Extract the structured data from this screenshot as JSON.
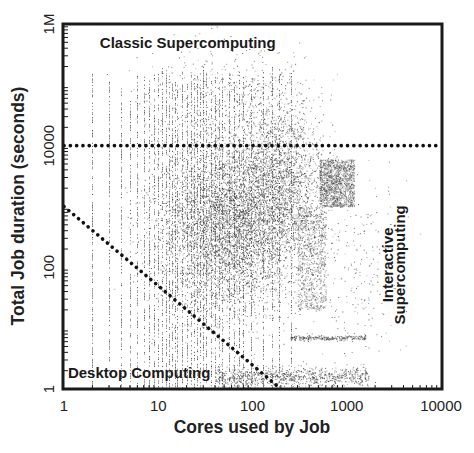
{
  "chart_data": {
    "type": "scatter",
    "title": "",
    "xlabel": "Cores used by Job",
    "ylabel": "Total Job duration (seconds)",
    "xscale": "log",
    "yscale": "log",
    "xlim": [
      1,
      10000
    ],
    "ylim": [
      1,
      1000000
    ],
    "x_ticks": [
      {
        "value": 1,
        "label": "1"
      },
      {
        "value": 10,
        "label": "10"
      },
      {
        "value": 100,
        "label": "100"
      },
      {
        "value": 1000,
        "label": "1000"
      },
      {
        "value": 10000,
        "label": "10000"
      }
    ],
    "y_ticks": [
      {
        "value": 1,
        "label": "1"
      },
      {
        "value": 100,
        "label": "100"
      },
      {
        "value": 10000,
        "label": "10000"
      },
      {
        "value": 1000000,
        "label": "1M"
      }
    ],
    "grid": false,
    "legend": null,
    "point_color": "#3a3a3a",
    "annotations": {
      "lines": [
        {
          "name": "classic-threshold-line",
          "style": "dotted",
          "from": [
            1,
            10000
          ],
          "to": [
            10000,
            10000
          ]
        },
        {
          "name": "desktop-boundary-line",
          "style": "dotted",
          "from": [
            1,
            1000
          ],
          "to": [
            200,
            1
          ]
        }
      ],
      "region_labels": [
        {
          "name": "classic-supercomputing-label",
          "text": "Classic Supercomputing",
          "x": 2.4,
          "y": 400000,
          "rotate": 0
        },
        {
          "name": "desktop-computing-label",
          "text": "Desktop Computing",
          "x": 1.1,
          "y": 1.5,
          "rotate": 0
        },
        {
          "name": "interactive-supercomputing-label-line1",
          "text": "Interactive",
          "x": 3100,
          "y": 110,
          "rotate": -90
        },
        {
          "name": "interactive-supercomputing-label-line2",
          "text": "Supercomputing",
          "x": 4200,
          "y": 110,
          "rotate": -90
        }
      ]
    },
    "series": [
      {
        "name": "single-core-stripes",
        "kind": "vertical_stripes",
        "x_values": [
          2,
          3,
          4,
          5,
          6,
          7,
          8,
          9,
          10,
          11,
          12,
          13,
          14,
          15,
          16,
          18,
          20,
          22,
          24,
          26,
          28,
          30,
          32,
          36,
          40,
          44,
          48,
          56,
          64,
          72,
          80,
          96,
          128,
          160,
          192,
          256
        ],
        "y_range": [
          1,
          500000
        ],
        "density": 0.55
      },
      {
        "name": "dense-core-cluster",
        "kind": "cloud",
        "x_center": 60,
        "x_spread_decades": 0.75,
        "y_center": 500,
        "y_spread_decades": 1.4,
        "count": 5200
      },
      {
        "name": "medium-jobs-cloud",
        "kind": "cloud",
        "x_center": 200,
        "x_spread_decades": 0.45,
        "y_center": 3000,
        "y_spread_decades": 1.3,
        "count": 1800
      },
      {
        "name": "interactive-block-upper",
        "kind": "block",
        "x_range": [
          512,
          1200
        ],
        "y_range": [
          1000,
          6000
        ],
        "count": 1500
      },
      {
        "name": "interactive-block-mid",
        "kind": "block",
        "x_range": [
          300,
          600
        ],
        "y_range": [
          20,
          1000
        ],
        "count": 900
      },
      {
        "name": "short-run-band",
        "kind": "band",
        "x_range": [
          40,
          1700
        ],
        "y_center": 1.6,
        "y_spread_decades": 0.08,
        "count": 900
      },
      {
        "name": "ten-second-band",
        "kind": "band",
        "x_range": [
          250,
          1600
        ],
        "y_center": 7,
        "y_spread_decades": 0.02,
        "count": 250
      },
      {
        "name": "sparse-upper-scatter",
        "kind": "cloud",
        "x_center": 60,
        "x_spread_decades": 0.9,
        "y_center": 60000,
        "y_spread_decades": 0.9,
        "count": 500
      },
      {
        "name": "sparse-right-scatter",
        "kind": "cloud",
        "x_center": 1500,
        "x_spread_decades": 0.4,
        "y_center": 100,
        "y_spread_decades": 1.5,
        "count": 200
      }
    ]
  }
}
